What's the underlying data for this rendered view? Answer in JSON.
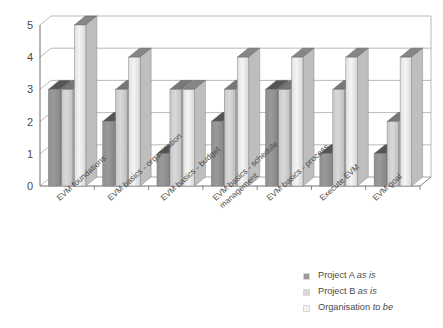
{
  "chart_data": {
    "type": "bar",
    "title": "",
    "subtitle": "",
    "xlabel": "",
    "ylabel": "",
    "ylim": [
      0,
      5
    ],
    "yticks": [
      "0",
      "1",
      "2",
      "3",
      "4",
      "5"
    ],
    "grid": true,
    "legend_position": "bottom-right",
    "three_d": true,
    "categories": [
      "EVM foundations",
      "EVM basics - organisation",
      "EVM basics - budget",
      "EVM basics - schedule\nmanagement",
      "EVM basics - process",
      "Execute EVM",
      "EVM goal"
    ],
    "series": [
      {
        "name": "Project A as is",
        "name_plain": "Project A",
        "name_italic": "as is",
        "color": "#9a9a9a",
        "values": [
          3,
          2,
          1,
          2,
          3,
          1,
          1
        ]
      },
      {
        "name": "Project B as is",
        "name_plain": "Project B",
        "name_italic": "as is",
        "color": "#d9d9d9",
        "values": [
          3,
          3,
          3,
          3,
          3,
          3,
          2
        ]
      },
      {
        "name": "Organisation to be",
        "name_plain": "Organisation",
        "name_italic": "to be",
        "color": "#f4f4f4",
        "values": [
          5,
          4,
          3,
          4,
          4,
          4,
          4
        ]
      }
    ]
  },
  "axis": {
    "tick_0": "0",
    "tick_1": "1",
    "tick_2": "2",
    "tick_3": "3",
    "tick_4": "4",
    "tick_5": "5"
  },
  "legend": {
    "items": [
      {
        "plain": "Project A ",
        "italic": "as is"
      },
      {
        "plain": "Project B ",
        "italic": "as is"
      },
      {
        "plain": "Organisation ",
        "italic": "to be"
      }
    ]
  },
  "colors": {
    "series_a": "#9a9a9a",
    "series_b": "#d9d9d9",
    "series_c": "#f4f4f4",
    "gridline": "#a8a8a8",
    "axis": "#6f6f6f",
    "text": "#4a4a4a",
    "background": "#ffffff"
  }
}
